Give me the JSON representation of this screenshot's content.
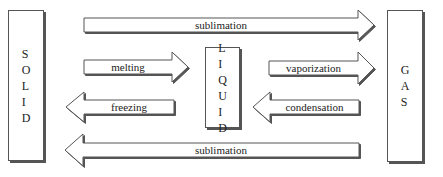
{
  "diagram": {
    "states": [
      {
        "id": "solid",
        "label": "SOLID",
        "x": 8,
        "y": 10,
        "w": 36,
        "h": 151
      },
      {
        "id": "liquid",
        "label": "LIQUID",
        "x": 205,
        "y": 47,
        "w": 35,
        "h": 81
      },
      {
        "id": "gas",
        "label": "GAS",
        "x": 387,
        "y": 10,
        "w": 36,
        "h": 152
      }
    ],
    "transitions": [
      {
        "id": "sublimation-top",
        "label": "sublimation",
        "from": "SOLID",
        "to": "GAS",
        "direction": "right",
        "shaft_start": 84,
        "shaft_end": 358,
        "tip": 374,
        "y_top": 18,
        "y_bottom": 32,
        "head_top": 10,
        "head_bottom": 40
      },
      {
        "id": "melting",
        "label": "melting",
        "from": "SOLID",
        "to": "LIQUID",
        "direction": "right",
        "shaft_start": 84,
        "shaft_end": 172,
        "tip": 188,
        "y_top": 60,
        "y_bottom": 74,
        "head_top": 52,
        "head_bottom": 82
      },
      {
        "id": "vaporization",
        "label": "vaporization",
        "from": "LIQUID",
        "to": "GAS",
        "direction": "right",
        "shaft_start": 269,
        "shaft_end": 358,
        "tip": 374,
        "y_top": 61,
        "y_bottom": 75,
        "head_top": 52,
        "head_bottom": 84
      },
      {
        "id": "freezing",
        "label": "freezing",
        "from": "LIQUID",
        "to": "SOLID",
        "direction": "left",
        "shaft_start": 174,
        "shaft_end": 84,
        "tip": 66,
        "y_top": 100,
        "y_bottom": 114,
        "head_top": 92,
        "head_bottom": 122
      },
      {
        "id": "condensation",
        "label": "condensation",
        "from": "GAS",
        "to": "LIQUID",
        "direction": "left",
        "shaft_start": 359,
        "shaft_end": 270,
        "tip": 253,
        "y_top": 100,
        "y_bottom": 114,
        "head_top": 92,
        "head_bottom": 122
      },
      {
        "id": "sublimation-bottom",
        "label": "sublimation",
        "from": "GAS",
        "to": "SOLID",
        "direction": "left",
        "shaft_start": 359,
        "shaft_end": 83,
        "tip": 65,
        "y_top": 143,
        "y_bottom": 157,
        "head_top": 134,
        "head_bottom": 166
      }
    ],
    "colors": {
      "stroke": "#555555",
      "shadow": "#555555",
      "fill": "#ffffff",
      "text": "#222222"
    }
  }
}
